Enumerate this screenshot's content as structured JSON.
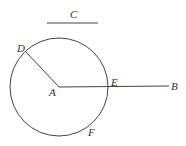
{
  "diagram": {
    "colors": {
      "line": "#444444",
      "text": "#333333",
      "background": "#ffffff"
    },
    "circle": {
      "cx": 59,
      "cy": 87,
      "r": 49
    },
    "segments": [
      {
        "name": "segment-c",
        "x1": 47,
        "y1": 23,
        "x2": 98,
        "y2": 23
      },
      {
        "name": "segment-ad",
        "x1": 59,
        "y1": 87,
        "x2": 26,
        "y2": 52
      },
      {
        "name": "segment-ab",
        "x1": 59,
        "y1": 87,
        "x2": 169,
        "y2": 86
      }
    ],
    "labels": {
      "C": "C",
      "D": "D",
      "A": "A",
      "E": "E",
      "B": "B",
      "F": "F"
    }
  }
}
